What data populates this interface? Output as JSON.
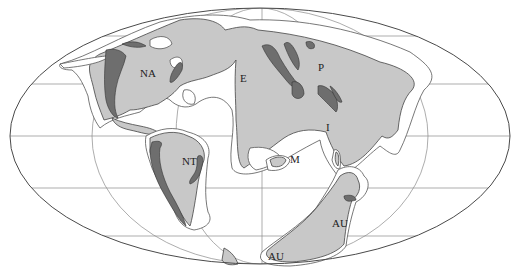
{
  "figure": {
    "caption_fragment": "",
    "projection": "ellipse world map (equal-area style)",
    "colors": {
      "land": "#c8c8c8",
      "mountains": "#6e6e6e",
      "shelf": "#ffffff",
      "grid": "#8a8a8a",
      "outline": "#4a4a4a"
    }
  },
  "labels": [
    {
      "id": "NA",
      "text": "NA",
      "x": 140,
      "y": 77
    },
    {
      "id": "E",
      "text": "E",
      "x": 240,
      "y": 82
    },
    {
      "id": "P",
      "text": "P",
      "x": 318,
      "y": 71
    },
    {
      "id": "I",
      "text": "I",
      "x": 326,
      "y": 131
    },
    {
      "id": "NT",
      "text": "NT",
      "x": 182,
      "y": 165
    },
    {
      "id": "M",
      "text": "M",
      "x": 290,
      "y": 163
    },
    {
      "id": "AU1",
      "text": "AU",
      "x": 332,
      "y": 227
    },
    {
      "id": "AU2",
      "text": "AU",
      "x": 268,
      "y": 260
    }
  ]
}
